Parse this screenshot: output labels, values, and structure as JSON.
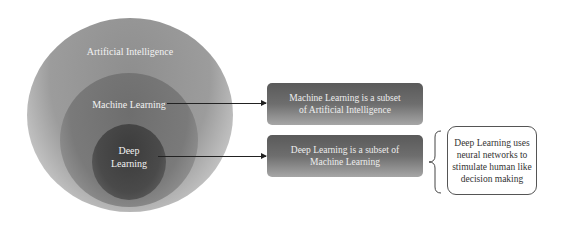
{
  "diagram": {
    "circles": {
      "outer": {
        "label": "Artificial Intelligence",
        "color": "#9c9c9c"
      },
      "middle": {
        "label": "Machine Learning",
        "color": "#7a7a7a"
      },
      "inner": {
        "label_line1": "Deep",
        "label_line2": "Learning",
        "color": "#4a4a4a"
      }
    },
    "boxes": [
      {
        "line1": "Machine Learning is a subset",
        "line2": "of  Artificial Intelligence"
      },
      {
        "line1": "Deep Learning is a subset of",
        "line2": "Machine Learning"
      }
    ],
    "callout": {
      "lines": [
        "Deep Learning uses",
        "neural networks to",
        "stimulate human like",
        "decision making"
      ]
    }
  }
}
